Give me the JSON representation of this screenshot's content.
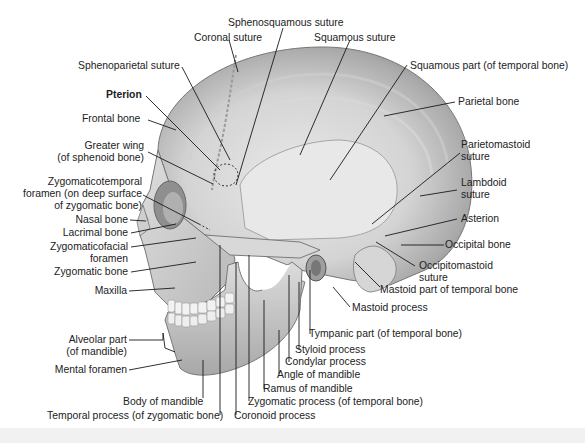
{
  "figure": {
    "colors": {
      "bone_light": "#e6e6e6",
      "bone_mid": "#bdbdbd",
      "bone_dark": "#8a8a8a",
      "leader_line": "#1a1a1a",
      "text": "#222222",
      "background": "#ffffff"
    },
    "labels": {
      "sphenosquamous_suture": "Sphenosquamous suture",
      "coronal_suture": "Coronal suture",
      "squamous_suture": "Squamous suture",
      "sphenoparietal_suture": "Sphenoparietal suture",
      "squamous_part": "Squamous part (of temporal bone)",
      "pterion": "Pterion",
      "frontal_bone": "Frontal bone",
      "parietal_bone": "Parietal bone",
      "greater_wing_1": "Greater wing",
      "greater_wing_2": "(of sphenoid bone)",
      "parietomastoid_1": "Parietomastoid",
      "parietomastoid_2": "suture",
      "zygomaticotemporal_1": "Zygomaticotemporal",
      "zygomaticotemporal_2": "foramen (on deep surface",
      "zygomaticotemporal_3": "of zygomatic bone)",
      "lambdoid_1": "Lambdoid",
      "lambdoid_2": "suture",
      "nasal_bone": "Nasal bone",
      "asterion": "Asterion",
      "lacrimal_bone": "Lacrimal bone",
      "zygomaticofacial_1": "Zygomaticofacial",
      "zygomaticofacial_2": "foramen",
      "occipital_bone": "Occipital bone",
      "zygomatic_bone": "Zygomatic bone",
      "occipitomastoid_1": "Occipitomastoid",
      "occipitomastoid_2": "suture",
      "mastoid_part": "Mastoid part of temporal bone",
      "maxilla": "Maxilla",
      "mastoid_process": "Mastoid process",
      "tympanic_part": "Tympanic part (of temporal bone)",
      "alveolar_1": "Alveolar part",
      "alveolar_2": "(of mandible)",
      "styloid_process": "Styloid process",
      "condylar_process": "Condylar process",
      "mental_foramen": "Mental foramen",
      "angle_of_mandible": "Angle of mandible",
      "ramus_of_mandible": "Ramus of mandible",
      "body_of_mandible": "Body of mandible",
      "zygomatic_process": "Zygomatic process (of temporal bone)",
      "temporal_process": "Temporal process (of zygomatic bone)",
      "coronoid_process": "Coronoid process"
    }
  }
}
